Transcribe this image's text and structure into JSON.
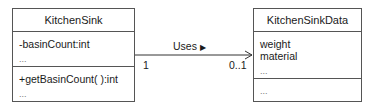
{
  "diagram": {
    "type": "uml-class-association",
    "classes": [
      {
        "name": "KitchenSink",
        "attributes": [
          "-basinCount:int",
          "..."
        ],
        "operations": [
          "+getBasinCount( ):int",
          "..."
        ]
      },
      {
        "name": "KitchenSinkData",
        "attributes": [
          "weight",
          "material",
          "..."
        ],
        "operations": [
          "..."
        ]
      }
    ],
    "association": {
      "label": "Uses",
      "direction_glyph": "▶",
      "source_multiplicity": "1",
      "target_multiplicity": "0..1",
      "navigability": "open-arrow-to-KitchenSinkData"
    }
  }
}
